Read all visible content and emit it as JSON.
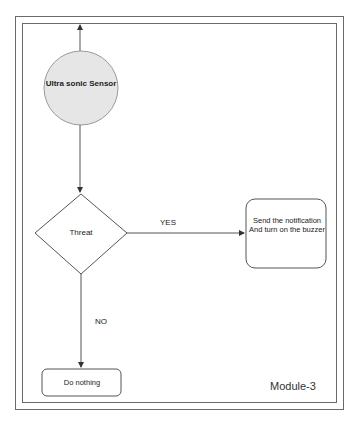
{
  "diagram": {
    "type": "flowchart",
    "module_label": "Module-3",
    "nodes": {
      "sensor": {
        "shape": "circle",
        "label": "Ultra sonic Sensor",
        "fill": "#e6e6e6",
        "stroke": "#9a9a9a"
      },
      "threat": {
        "shape": "diamond",
        "label": "Threat"
      },
      "notify": {
        "shape": "rounded-rect",
        "label": "Send the notification And turn on the buzzer"
      },
      "nothing": {
        "shape": "rounded-rect",
        "label": "Do nothing"
      }
    },
    "edges": {
      "yes": {
        "from": "threat",
        "to": "notify",
        "label": "YES"
      },
      "no": {
        "from": "threat",
        "to": "nothing",
        "label": "NO"
      },
      "sensor_to_threat": {
        "from": "sensor",
        "to": "threat",
        "label": ""
      },
      "sensor_up": {
        "from": "sensor",
        "to": "frame-top",
        "label": ""
      }
    },
    "colors": {
      "line": "#444444",
      "frame": "#6a6a6a",
      "text": "#222222"
    }
  }
}
